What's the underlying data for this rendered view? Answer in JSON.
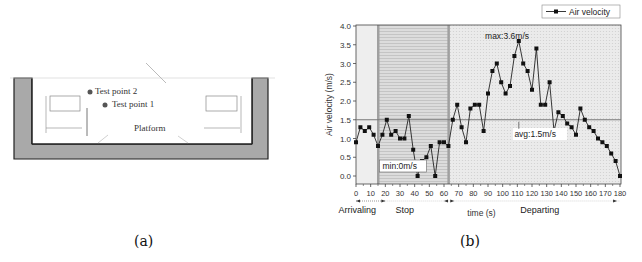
{
  "panel_a": {
    "caption": "(a)",
    "labels": {
      "test_point_2": "Test point 2",
      "test_point_1": "Test point 1",
      "platform": "Platform"
    }
  },
  "panel_b": {
    "caption": "(b)",
    "phases": [
      "Arrivaling",
      "Stop",
      "Departing"
    ],
    "annotations": {
      "max": "max:3.6m/s",
      "min": "min:0m/s",
      "avg": "avg:1.5m/s"
    }
  },
  "chart_data": {
    "type": "line",
    "title": "",
    "xlabel": "time (s)",
    "ylabel": "Air velocity (m/s)",
    "xlim": [
      0,
      180
    ],
    "ylim": [
      -0.2,
      4.0
    ],
    "x_ticks": [
      0,
      10,
      20,
      30,
      40,
      50,
      60,
      70,
      80,
      90,
      100,
      110,
      120,
      130,
      140,
      150,
      160,
      170,
      180
    ],
    "y_ticks": [
      "0.0",
      "0.5",
      "1.0",
      "1.5",
      "2.0",
      "2.5",
      "3.0",
      "3.5",
      "4.0"
    ],
    "legend": [
      "Air velocity"
    ],
    "legend_position": "top-right",
    "grid": false,
    "reference_line": {
      "y": 1.5,
      "label": "avg:1.5m/s"
    },
    "regions": [
      {
        "name": "Arrivaling",
        "x_start": 0,
        "x_end": 15
      },
      {
        "name": "Stop",
        "x_start": 15,
        "x_end": 63
      },
      {
        "name": "Departing",
        "x_start": 63,
        "x_end": 180
      }
    ],
    "series": [
      {
        "name": "Air velocity",
        "x": [
          0,
          3,
          6,
          9,
          12,
          15,
          18,
          21,
          24,
          27,
          30,
          33,
          36,
          39,
          42,
          45,
          48,
          51,
          54,
          57,
          60,
          63,
          66,
          69,
          72,
          75,
          78,
          81,
          84,
          87,
          90,
          93,
          96,
          99,
          102,
          105,
          108,
          111,
          114,
          117,
          120,
          123,
          126,
          129,
          132,
          135,
          138,
          141,
          144,
          147,
          150,
          153,
          156,
          159,
          162,
          165,
          168,
          171,
          174,
          177,
          180
        ],
        "values": [
          0.9,
          1.3,
          1.2,
          1.3,
          1.1,
          0.8,
          1.1,
          1.5,
          1.1,
          1.2,
          1.0,
          1.0,
          1.6,
          0.7,
          0.0,
          0.4,
          0.5,
          0.8,
          0.0,
          0.9,
          0.9,
          0.8,
          1.5,
          1.9,
          1.3,
          0.9,
          1.8,
          1.9,
          1.9,
          1.2,
          2.2,
          2.8,
          3.0,
          2.5,
          2.2,
          2.4,
          3.2,
          3.6,
          3.0,
          2.8,
          2.3,
          3.4,
          1.9,
          1.9,
          2.5,
          1.2,
          1.7,
          1.6,
          1.4,
          1.3,
          1.1,
          1.8,
          1.5,
          1.3,
          1.2,
          1.0,
          0.9,
          0.8,
          0.6,
          0.4,
          0.0
        ]
      }
    ],
    "annotations": [
      "max:3.6m/s",
      "min:0m/s",
      "avg:1.5m/s"
    ]
  }
}
